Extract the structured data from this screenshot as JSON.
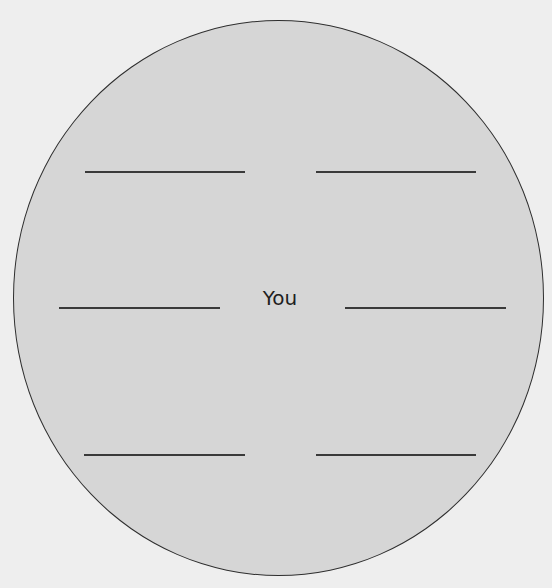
{
  "diagram": {
    "type": "circle-worksheet",
    "center_label": "You",
    "colors": {
      "background": "#eeeeee",
      "circle_fill": "#d6d6d6",
      "stroke": "#2e2e2e",
      "text": "#1e1e1e"
    },
    "blanks": [
      {
        "position": "top-left",
        "x1": 85,
        "x2": 245,
        "y": 172,
        "value": ""
      },
      {
        "position": "top-right",
        "x1": 316,
        "x2": 476,
        "y": 172,
        "value": ""
      },
      {
        "position": "middle-left",
        "x1": 59,
        "x2": 220,
        "y": 308,
        "value": ""
      },
      {
        "position": "middle-right",
        "x1": 345,
        "x2": 506,
        "y": 308,
        "value": ""
      },
      {
        "position": "bottom-left",
        "x1": 84,
        "x2": 245,
        "y": 455,
        "value": ""
      },
      {
        "position": "bottom-right",
        "x1": 316,
        "x2": 476,
        "y": 455,
        "value": ""
      }
    ]
  }
}
